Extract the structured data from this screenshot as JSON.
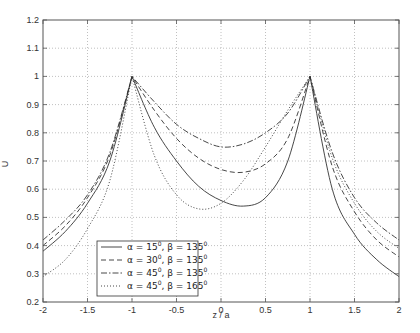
{
  "chart_data": {
    "type": "line",
    "title": "",
    "xlabel": "z / a",
    "ylabel": "U",
    "xlim": [
      -2,
      2
    ],
    "ylim": [
      0.2,
      1.2
    ],
    "grid": true,
    "legend_position": "lower-left",
    "xticks": [
      -2,
      -1.5,
      -1,
      -0.5,
      0,
      0.5,
      1,
      1.5,
      2
    ],
    "xtick_labels": [
      "-2",
      "-1.5",
      "-1",
      "-0.5",
      "0",
      "0.5",
      "1",
      "1.5",
      "2"
    ],
    "yticks": [
      0.2,
      0.3,
      0.4,
      0.5,
      0.6,
      0.7,
      0.8,
      0.9,
      1.0,
      1.1,
      1.2
    ],
    "ytick_labels": [
      "0.2",
      "0.3",
      "0.4",
      "0.5",
      "0.6",
      "0.7",
      "0.8",
      "0.9",
      "1",
      "1.1",
      "1.2"
    ],
    "x": [
      -2,
      -1.75,
      -1.5,
      -1.25,
      -1,
      -0.75,
      -0.5,
      -0.25,
      0,
      0.25,
      0.5,
      0.75,
      1,
      1.25,
      1.5,
      1.75,
      2
    ],
    "series": [
      {
        "name": "α = 15⁰, β = 135⁰",
        "alpha": "15",
        "beta": "135",
        "style": "solid",
        "values": [
          0.38,
          0.45,
          0.55,
          0.7,
          1.0,
          0.82,
          0.7,
          0.61,
          0.56,
          0.54,
          0.57,
          0.7,
          1.0,
          0.6,
          0.44,
          0.35,
          0.29
        ]
      },
      {
        "name": "α = 30⁰, β = 135⁰",
        "alpha": "30",
        "beta": "135",
        "style": "dashed",
        "values": [
          0.4,
          0.47,
          0.57,
          0.72,
          1.0,
          0.88,
          0.78,
          0.71,
          0.67,
          0.66,
          0.69,
          0.78,
          1.0,
          0.68,
          0.52,
          0.42,
          0.36
        ]
      },
      {
        "name": "α = 45⁰, β = 135⁰",
        "alpha": "45",
        "beta": "135",
        "style": "dashdot",
        "values": [
          0.42,
          0.49,
          0.58,
          0.73,
          1.0,
          0.91,
          0.83,
          0.78,
          0.75,
          0.76,
          0.8,
          0.87,
          1.0,
          0.73,
          0.57,
          0.48,
          0.42
        ]
      },
      {
        "name": "α = 45⁰, β = 165⁰",
        "alpha": "45",
        "beta": "165",
        "style": "dotted",
        "values": [
          0.29,
          0.35,
          0.46,
          0.63,
          1.0,
          0.72,
          0.58,
          0.53,
          0.55,
          0.63,
          0.75,
          0.88,
          1.0,
          0.71,
          0.55,
          0.45,
          0.39
        ]
      }
    ]
  },
  "legend": {
    "entries": [
      {
        "prefix": "α = 15",
        "mid": ", β = 135",
        "sup": "0"
      },
      {
        "prefix": "α = 30",
        "mid": ", β = 135",
        "sup": "0"
      },
      {
        "prefix": "α = 45",
        "mid": ", β = 135",
        "sup": "0"
      },
      {
        "prefix": "α = 45",
        "mid": ", β = 165",
        "sup": "0"
      }
    ]
  },
  "colors": {
    "axis": "#555555",
    "grid": "#b0b0b0",
    "line": "#333333"
  }
}
